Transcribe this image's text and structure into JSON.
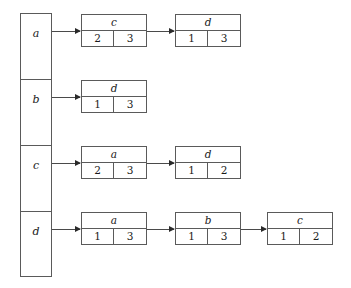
{
  "diagram": {
    "type": "adjacency-list",
    "title": "",
    "vertices": [
      "a",
      "b",
      "c",
      "d"
    ],
    "rows": [
      {
        "vertex": "a",
        "nodes": [
          {
            "label": "c",
            "left": "2",
            "right": "3"
          },
          {
            "label": "d",
            "left": "1",
            "right": "3"
          }
        ]
      },
      {
        "vertex": "b",
        "nodes": [
          {
            "label": "d",
            "left": "1",
            "right": "3"
          }
        ]
      },
      {
        "vertex": "c",
        "nodes": [
          {
            "label": "a",
            "left": "2",
            "right": "3"
          },
          {
            "label": "d",
            "left": "1",
            "right": "2"
          }
        ]
      },
      {
        "vertex": "d",
        "nodes": [
          {
            "label": "a",
            "left": "1",
            "right": "3"
          },
          {
            "label": "b",
            "left": "1",
            "right": "3"
          },
          {
            "label": "c",
            "left": "1",
            "right": "2"
          }
        ]
      }
    ],
    "colors": {
      "line": "#5a5a5a",
      "arrow": "#2a2a2a",
      "text": "#1a1a1a",
      "background": "#ffffff"
    }
  }
}
